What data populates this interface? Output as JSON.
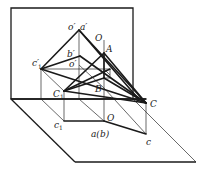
{
  "figure": {
    "type": "descriptive-geometry-projection",
    "labels": {
      "o_prime": "o′",
      "a_prime": "a′",
      "O_top": "O",
      "A": "A",
      "b_prime": "b′",
      "c1_prime": "c′",
      "c1_prime_sub": "1",
      "o_double_prime": "o′",
      "o_double_prime_sub": "1",
      "C1": "C",
      "C1_sub": "1",
      "B": "B",
      "C": "C",
      "O_bottom": "O",
      "c1": "c",
      "c1_sub": "1",
      "a_b": "a(b)",
      "c": "c"
    },
    "colors": {
      "line": "#1a1a1a",
      "background": "#ffffff"
    }
  }
}
